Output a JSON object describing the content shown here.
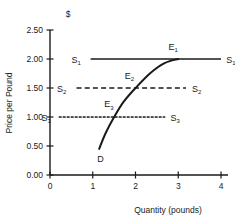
{
  "chart_data": {
    "type": "line",
    "title": "",
    "currency_symbol": "$",
    "xlabel": "Quantity (pounds)",
    "ylabel": "Price per Pound",
    "xlim": [
      0,
      4
    ],
    "ylim": [
      0,
      2.5
    ],
    "grid": false,
    "legend": "inline-labels",
    "x_ticks": [
      "0",
      "1",
      "2",
      "3",
      "4"
    ],
    "x_tick_values": [
      0,
      1,
      2,
      3,
      4
    ],
    "y_ticks": [
      "0.00",
      "0.50",
      "1.00",
      "1.50",
      "2.00",
      "2.50"
    ],
    "y_tick_values": [
      0,
      0.5,
      1.0,
      1.5,
      2.0,
      2.5
    ],
    "series": [
      {
        "name": "S1",
        "label": "S",
        "subscript": "1",
        "style": "solid",
        "price": 2.0,
        "x_start": 0.95,
        "x_end": 4.0,
        "left_label_x": 0.72,
        "right_label_x": 4.12
      },
      {
        "name": "S2",
        "label": "S",
        "subscript": "2",
        "style": "dashed",
        "price": 1.5,
        "x_start": 0.62,
        "x_end": 3.18,
        "left_label_x": 0.38,
        "right_label_x": 3.32
      },
      {
        "name": "S3",
        "label": "S",
        "subscript": "3",
        "style": "dotted",
        "price": 1.0,
        "x_start": 0.22,
        "x_end": 2.68,
        "left_label_x": 0.02,
        "right_label_x": 2.82
      }
    ],
    "demand_curve": {
      "name": "D",
      "label": "D",
      "points": [
        [
          1.15,
          0.45
        ],
        [
          1.3,
          0.72
        ],
        [
          1.5,
          1.0
        ],
        [
          1.72,
          1.26
        ],
        [
          2.0,
          1.5
        ],
        [
          2.35,
          1.76
        ],
        [
          2.68,
          1.93
        ],
        [
          3.0,
          2.0
        ]
      ],
      "label_x": 1.18,
      "label_y": 0.22
    },
    "equilibria": [
      {
        "name": "E1",
        "label": "E",
        "subscript": "1",
        "x": 3.0,
        "y": 2.0,
        "label_x": 2.88,
        "label_y": 2.16
      },
      {
        "name": "E2",
        "label": "E",
        "subscript": "2",
        "x": 2.0,
        "y": 1.5,
        "label_x": 1.86,
        "label_y": 1.66
      },
      {
        "name": "E3",
        "label": "E",
        "subscript": "3",
        "x": 1.5,
        "y": 1.0,
        "label_x": 1.38,
        "label_y": 1.17
      }
    ]
  }
}
